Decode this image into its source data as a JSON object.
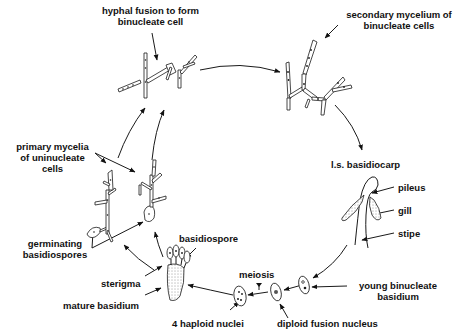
{
  "diagram": {
    "colors": {
      "ink": "#111111",
      "background": "#ffffff"
    },
    "labels": {
      "hyphal_fusion_line1": "hyphal fusion to form",
      "hyphal_fusion_line2": "binucleate cell",
      "secondary_mycelium_line1": "secondary mycelium of",
      "secondary_mycelium_line2": "binucleate cells",
      "basidiocarp": "l.s. basidiocarp",
      "pileus": "pileus",
      "gill": "gill",
      "stipe": "stipe",
      "young_basidium_line1": "young binucleate",
      "young_basidium_line2": "basidium",
      "diploid_fusion_nucleus": "diploid fusion nucleus",
      "meiosis": "meiosis",
      "haploid_nuclei": "4 haploid nuclei",
      "mature_basidium": "mature basidium",
      "sterigma": "sterigma",
      "basidiospore": "basidiospore",
      "germinating_line1": "germinating",
      "germinating_line2": "basidiospores",
      "primary_mycelia_line1": "primary mycelia",
      "primary_mycelia_line2": "of uninucleate",
      "primary_mycelia_line3": "cells"
    },
    "stages": [
      "primary mycelia of uninucleate cells",
      "hyphal fusion to form binucleate cell",
      "secondary mycelium of binucleate cells",
      "l.s. basidiocarp",
      "young binucleate basidium",
      "diploid fusion nucleus",
      "meiosis",
      "4 haploid nuclei",
      "mature basidium",
      "basidiospore",
      "germinating basidiospores"
    ]
  }
}
